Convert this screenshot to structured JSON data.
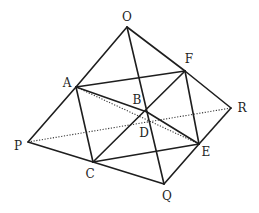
{
  "diagram": {
    "type": "geometry-figure",
    "points": {
      "O": {
        "label": "O",
        "x": 127,
        "y": 27,
        "lx": 127,
        "ly": 21
      },
      "F": {
        "label": "F",
        "x": 185,
        "y": 71,
        "lx": 189,
        "ly": 63
      },
      "A": {
        "label": "A",
        "x": 76,
        "y": 87,
        "lx": 67,
        "ly": 87
      },
      "B": {
        "label": "B",
        "x": 147,
        "y": 112,
        "lx": 137,
        "ly": 104
      },
      "R": {
        "label": "R",
        "x": 231,
        "y": 108,
        "lx": 242,
        "ly": 112
      },
      "D": {
        "label": "D",
        "x": 142,
        "y": 122,
        "lx": 144,
        "ly": 137
      },
      "P": {
        "label": "P",
        "x": 28,
        "y": 142,
        "lx": 18,
        "ly": 150
      },
      "E": {
        "label": "E",
        "x": 199,
        "y": 144,
        "lx": 206,
        "ly": 156
      },
      "C": {
        "label": "C",
        "x": 93,
        "y": 162,
        "lx": 90,
        "ly": 178
      },
      "Q": {
        "label": "Q",
        "x": 164,
        "y": 184,
        "lx": 167,
        "ly": 200
      }
    },
    "solid_segments": [
      [
        "O",
        "A"
      ],
      [
        "A",
        "P"
      ],
      [
        "P",
        "C"
      ],
      [
        "C",
        "Q"
      ],
      [
        "Q",
        "E"
      ],
      [
        "E",
        "R"
      ],
      [
        "R",
        "F"
      ],
      [
        "F",
        "O"
      ],
      [
        "A",
        "F"
      ],
      [
        "F",
        "E"
      ],
      [
        "E",
        "C"
      ],
      [
        "C",
        "A"
      ],
      [
        "O",
        "Q"
      ],
      [
        "A",
        "B"
      ],
      [
        "B",
        "E"
      ],
      [
        "C",
        "F"
      ]
    ],
    "dotted_segments": [
      [
        "P",
        "R"
      ],
      [
        "A",
        "E"
      ]
    ]
  }
}
